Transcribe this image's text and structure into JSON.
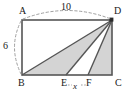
{
  "figure": {
    "kind": "geometry-diagram",
    "shape": "rectangle-with-inscribed-triangles",
    "colors": {
      "outline": "#4a4a4a",
      "shading": "#d4d4d4",
      "guide": "#9a9a9a",
      "label": "#1a1a1a",
      "background": "#ffffff"
    }
  },
  "vertex_labels": {
    "top_left": "A",
    "top_right": "D",
    "bottom_left": "B",
    "bottom_right": "C",
    "base_point_1": "E",
    "base_point_2": "F"
  },
  "dimensions": {
    "top_length": "10",
    "left_height": "6",
    "segment_ef": "x"
  },
  "geometry": {
    "rect": {
      "x1": 22,
      "y1": 20,
      "x2": 112,
      "y2": 75
    },
    "point_E_x": 66,
    "point_F_x": 88,
    "cevian_apex": {
      "x": 112,
      "y": 20
    },
    "shaded_triangles": [
      {
        "name": "DBE",
        "points": "22,75 66,75 112,20"
      },
      {
        "name": "DFC",
        "points": "88,75 112,75 112,20"
      }
    ],
    "unshaded_triangles": [
      {
        "name": "DEF",
        "points": "66,75 88,75 112,20"
      }
    ],
    "cevian_lines": [
      {
        "from": "D",
        "to": "B"
      },
      {
        "from": "D",
        "to": "E"
      },
      {
        "from": "D",
        "to": "F"
      }
    ],
    "guide_arcs": [
      {
        "name": "top-span-arc",
        "label_ref": "dimensions.top_length"
      },
      {
        "name": "left-span-arc",
        "label_ref": "dimensions.left_height"
      }
    ],
    "apex_marker": {
      "name": "vertex-dot-D",
      "x": 112,
      "y": 20
    }
  }
}
